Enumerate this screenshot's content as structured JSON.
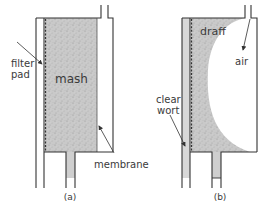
{
  "panels": {
    "a": {
      "caption": "(a)",
      "labels": {
        "filter_pad_line1": "filter",
        "filter_pad_line2": "pad",
        "mash": "mash",
        "membrane": "membrane"
      }
    },
    "b": {
      "caption": "(b)",
      "labels": {
        "draff": "draff",
        "air": "air",
        "clear_wort_line1": "clear",
        "clear_wort_line2": "wort"
      }
    }
  },
  "colors": {
    "outline": "#333333",
    "mash_fill": "#c8c8c8",
    "wort_fill": "#d4d4d4",
    "text": "#3a3a3a",
    "background": "#ffffff"
  }
}
